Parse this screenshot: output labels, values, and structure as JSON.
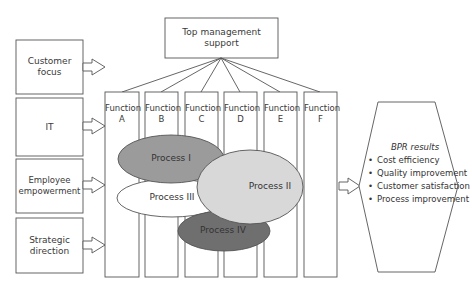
{
  "diagram": {
    "top": {
      "label": "Top management support"
    },
    "enablers": [
      {
        "label": "Customer focus"
      },
      {
        "label": "IT"
      },
      {
        "label": "Employee empowerment"
      },
      {
        "label": "Strategic direction"
      }
    ],
    "functions": [
      {
        "label": "Function",
        "letter": "A"
      },
      {
        "label": "Function",
        "letter": "B"
      },
      {
        "label": "Function",
        "letter": "C"
      },
      {
        "label": "Function",
        "letter": "D"
      },
      {
        "label": "Function",
        "letter": "E"
      },
      {
        "label": "Function",
        "letter": "F"
      }
    ],
    "processes": [
      {
        "label": "Process I",
        "fill": "#9b9b9b"
      },
      {
        "label": "Process II",
        "fill": "#d8d8d8"
      },
      {
        "label": "Process III",
        "fill": "#ffffff"
      },
      {
        "label": "Process IV",
        "fill": "#6f6f6f"
      }
    ],
    "results": {
      "title": "BPR results",
      "items": [
        "Cost efficiency",
        "Quality improvement",
        "Customer satisfaction",
        "Process improvement"
      ]
    }
  }
}
